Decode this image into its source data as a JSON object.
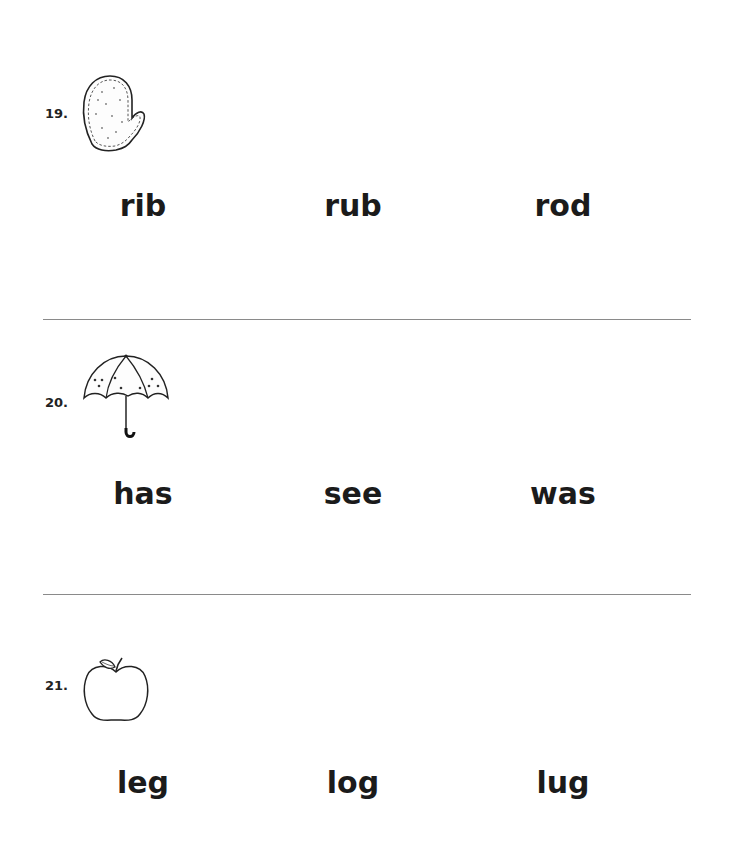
{
  "items": [
    {
      "number": "19.",
      "picture": "mitten-icon",
      "choices": [
        "rib",
        "rub",
        "rod"
      ]
    },
    {
      "number": "20.",
      "picture": "umbrella-icon",
      "choices": [
        "has",
        "see",
        "was"
      ]
    },
    {
      "number": "21.",
      "picture": "apple-icon",
      "choices": [
        "leg",
        "log",
        "lug"
      ]
    }
  ]
}
